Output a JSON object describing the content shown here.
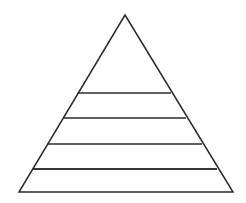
{
  "document": {
    "kind": "pyramid-diagram",
    "background_color": "#ffffff",
    "width": 246,
    "height": 203
  },
  "chart_data": {
    "type": "pyramid",
    "title": "",
    "subtitle": "",
    "xlabel": "",
    "ylabel": "",
    "grid": false,
    "legend": false,
    "filled": false,
    "label_text_present": false,
    "stroke_color": "#2b2b2b",
    "stroke_width": 1.5,
    "fill_color": "#ffffff",
    "apex": {
      "x": 125,
      "y": 15
    },
    "base_left": {
      "x": 19,
      "y": 192
    },
    "base_right": {
      "x": 233,
      "y": 192
    },
    "level_count": 6,
    "divider_count": 5,
    "dividers": [
      {
        "index": 1,
        "y": 68,
        "x_left": 94,
        "x_right": 156
      },
      {
        "index": 2,
        "y": 93,
        "x_left": 79,
        "x_right": 171
      },
      {
        "index": 3,
        "y": 118,
        "x_left": 64,
        "x_right": 186
      },
      {
        "index": 4,
        "y": 144,
        "x_left": 48,
        "x_right": 202
      },
      {
        "index": 5,
        "y": 169,
        "x_left": 33,
        "x_right": 217
      }
    ],
    "bands": [
      {
        "index": 1,
        "name": "band-top",
        "y_top": 15,
        "y_bottom": 68,
        "label": ""
      },
      {
        "index": 2,
        "name": "band-second",
        "y_top": 68,
        "y_bottom": 93,
        "label": ""
      },
      {
        "index": 3,
        "name": "band-third",
        "y_top": 93,
        "y_bottom": 118,
        "label": ""
      },
      {
        "index": 4,
        "name": "band-fourth",
        "y_top": 118,
        "y_bottom": 144,
        "label": ""
      },
      {
        "index": 5,
        "name": "band-fifth",
        "y_top": 144,
        "y_bottom": 169,
        "label": ""
      },
      {
        "index": 6,
        "name": "band-base",
        "y_top": 169,
        "y_bottom": 192,
        "label": ""
      }
    ]
  }
}
